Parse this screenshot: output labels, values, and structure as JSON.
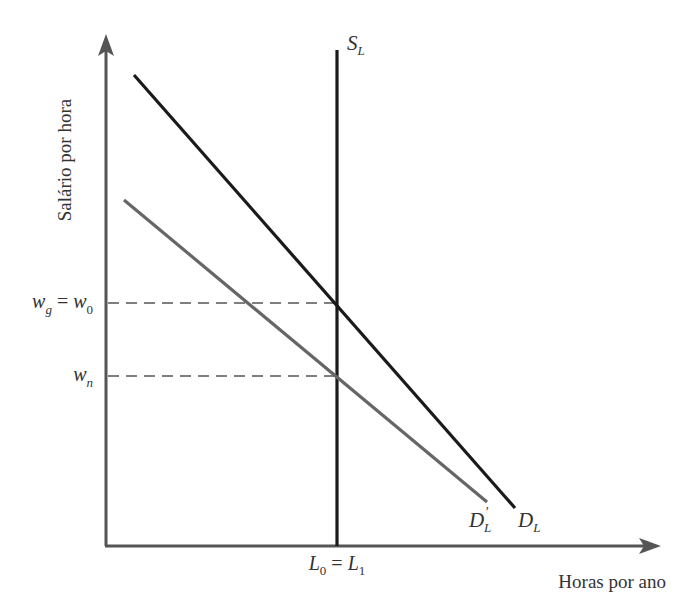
{
  "diagram": {
    "type": "economics-labor-market",
    "y_axis_label": "Salário por hora",
    "x_axis_label": "Horas por ano",
    "curves": [
      {
        "id": "supply",
        "label_main": "S",
        "label_sub": "L",
        "description": "Vertical labor supply curve",
        "color": "#1a1a1a"
      },
      {
        "id": "demand",
        "label_main": "D",
        "label_sub": "L",
        "description": "Original labor demand curve",
        "color": "#1a1a1a"
      },
      {
        "id": "demand-shifted",
        "label_main": "D",
        "label_prime": "′",
        "label_sub": "L",
        "description": "Shifted labor demand curve",
        "color": "#666666"
      }
    ],
    "y_ticks": [
      {
        "id": "wg-w0",
        "main_a": "w",
        "sub_a": "g",
        "eq": " = ",
        "main_b": "w",
        "sub_b": "0"
      },
      {
        "id": "wn",
        "main_a": "w",
        "sub_a": "n"
      }
    ],
    "x_ticks": [
      {
        "id": "l0-l1",
        "main_a": "L",
        "sub_a": "0",
        "eq": " = ",
        "main_b": "L",
        "sub_b": "1"
      }
    ],
    "colors": {
      "axis": "#555555",
      "primary_line": "#1a1a1a",
      "shifted_line": "#666666",
      "dashed": "#555555"
    }
  }
}
